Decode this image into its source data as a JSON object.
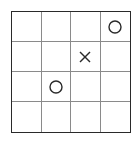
{
  "game": {
    "type": "tic-tac-toe-4x4",
    "rows": 4,
    "cols": 4,
    "board": [
      [
        "",
        "",
        "",
        "O"
      ],
      [
        "",
        "",
        "X",
        ""
      ],
      [
        "",
        "O",
        "",
        ""
      ],
      [
        "",
        "",
        "",
        ""
      ]
    ]
  },
  "colors": {
    "border": "#2a2a2a",
    "grid_line": "#8a8a8a",
    "mark": "#2a2a2a",
    "background": "#ffffff"
  }
}
